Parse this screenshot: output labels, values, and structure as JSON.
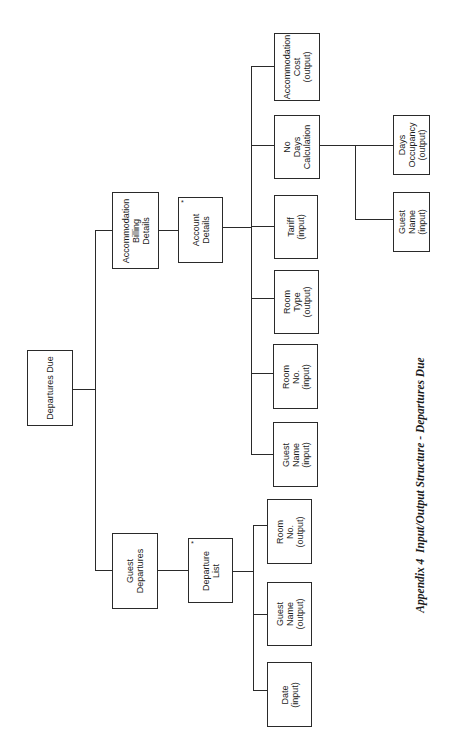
{
  "page": {
    "header_text": "",
    "caption": "Appendix 4  Input/Output Structure - Departures Due"
  },
  "diagram": {
    "type": "jackson-structure-diagram",
    "orientation": "rotated-90-ccw",
    "root": {
      "label": "Departures Due"
    },
    "level1": [
      {
        "id": "billing",
        "label": "Accommodation\nBilling\nDetails"
      },
      {
        "id": "guest_departures",
        "label": "Guest\nDepartures"
      }
    ],
    "level2": [
      {
        "id": "account_details",
        "label": "Account\nDetails",
        "iteration_marker": "*",
        "parent": "billing"
      },
      {
        "id": "departure_list",
        "label": "Departure\nList",
        "iteration_marker": "*",
        "parent": "guest_departures"
      }
    ],
    "account_children": [
      {
        "label": "Accommodation\nCost\n(output)"
      },
      {
        "label": "No\nDays\nCalculation"
      },
      {
        "label": "Tariff\n(input)"
      },
      {
        "label": "Room\nType\n(output)"
      },
      {
        "label": "Room\nNo.\n(input)"
      },
      {
        "label": "Guest\nName\n(input)"
      }
    ],
    "calculation_children": [
      {
        "label": "Days\nOccupancy\n(output)"
      },
      {
        "label": "Guest\nName\n(input)"
      }
    ],
    "departure_list_children": [
      {
        "label": "Room\nNo.\n(output)"
      },
      {
        "label": "Guest\nName\n(output)"
      },
      {
        "label": "Date\n(input)"
      }
    ]
  }
}
